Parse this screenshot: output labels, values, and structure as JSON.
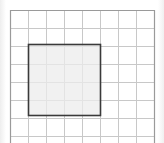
{
  "diagram": {
    "type": "grid-with-shaded-square",
    "grid": {
      "columns": 8,
      "rows_visible": 8,
      "cell_size_px": 18,
      "origin": [
        10,
        10
      ],
      "line_color": "#c8c8c8",
      "frame_color": "#9a9a9a"
    },
    "square": {
      "grid_col_start": 1,
      "grid_row_start": 2,
      "size_cells": 4,
      "fill_color": "#ececec",
      "border_color": "#3a3a3a"
    }
  }
}
